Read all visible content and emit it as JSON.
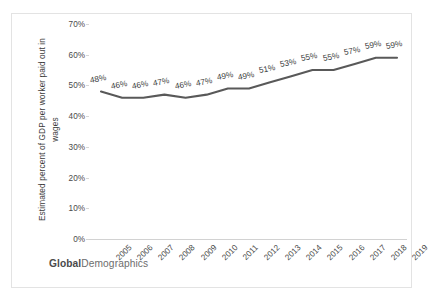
{
  "brand": {
    "bold_part": "Global",
    "regular_part": "Demographics"
  },
  "chart_data": {
    "type": "line",
    "title": "",
    "xlabel": "",
    "ylabel": "Estimated percent of GDP per worker paid out in wages",
    "ylabel_lines": [
      "Estimated percent of GDP per worker paid out in",
      "wages"
    ],
    "ylim": [
      0,
      70
    ],
    "yticks": [
      0,
      10,
      20,
      30,
      40,
      50,
      60,
      70
    ],
    "ytick_labels": [
      "0%",
      "10%",
      "20%",
      "30%",
      "40%",
      "50%",
      "60%",
      "70%"
    ],
    "grid": false,
    "legend": "none",
    "line_color": "#595959",
    "categories": [
      "2005",
      "2006",
      "2007",
      "2008",
      "2009",
      "2010",
      "2011",
      "2012",
      "2013",
      "2014",
      "2015",
      "2016",
      "2017",
      "2018",
      "2019"
    ],
    "values": [
      48,
      46,
      46,
      47,
      46,
      47,
      49,
      49,
      51,
      53,
      55,
      55,
      57,
      59,
      59
    ],
    "point_labels": [
      "48%",
      "46%",
      "46%",
      "47%",
      "46%",
      "47%",
      "49%",
      "49%",
      "51%",
      "53%",
      "55%",
      "55%",
      "57%",
      "59%",
      "59%"
    ]
  }
}
